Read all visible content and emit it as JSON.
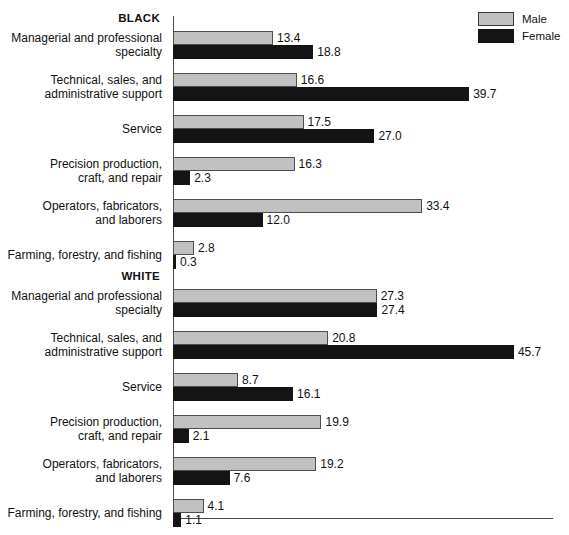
{
  "legend": {
    "position": "top-right",
    "items": [
      {
        "name": "Male",
        "swatch": "male-swatch",
        "color": "#c1c1c1"
      },
      {
        "name": "Female",
        "swatch": "female-swatch",
        "color": "#141414"
      }
    ]
  },
  "groups": [
    {
      "id": "black",
      "heading": "BLACK"
    },
    {
      "id": "white",
      "heading": "WHITE"
    }
  ],
  "chart_data": {
    "type": "bar",
    "orientation": "horizontal",
    "title": "",
    "subtitle": "",
    "xlabel": "",
    "ylabel": "",
    "xlim": [
      0,
      51
    ],
    "grid": false,
    "legend_position": "top-right",
    "value_format": "one-decimal",
    "categories": [
      "Managerial and professional specialty",
      "Technical, sales, and administrative support",
      "Service",
      "Precision production, craft, and repair",
      "Operators, fabricators, and laborers",
      "Farming, forestry, and fishing"
    ],
    "panels": [
      {
        "name": "BLACK",
        "series": [
          {
            "name": "Male",
            "values": [
              13.4,
              16.6,
              17.5,
              16.3,
              33.4,
              2.8
            ]
          },
          {
            "name": "Female",
            "values": [
              18.8,
              39.7,
              27.0,
              2.3,
              12.0,
              0.3
            ]
          }
        ]
      },
      {
        "name": "WHITE",
        "series": [
          {
            "name": "Male",
            "values": [
              27.3,
              20.8,
              8.7,
              19.9,
              19.2,
              4.1
            ]
          },
          {
            "name": "Female",
            "values": [
              27.4,
              45.7,
              16.1,
              2.1,
              7.6,
              1.1
            ]
          }
        ]
      }
    ]
  },
  "rows": {
    "black": [
      {
        "label_line1": "Managerial and professional",
        "label_line2": "specialty",
        "male": "13.4",
        "female": "18.8"
      },
      {
        "label_line1": "Technical, sales, and",
        "label_line2": "administrative support",
        "male": "16.6",
        "female": "39.7"
      },
      {
        "label_line1": "Service",
        "label_line2": "",
        "male": "17.5",
        "female": "27.0"
      },
      {
        "label_line1": "Precision production,",
        "label_line2": "craft, and repair",
        "male": "16.3",
        "female": "2.3"
      },
      {
        "label_line1": "Operators, fabricators,",
        "label_line2": "and laborers",
        "male": "33.4",
        "female": "12.0"
      },
      {
        "label_line1": "Farming, forestry, and fishing",
        "label_line2": "",
        "male": "2.8",
        "female": "0.3"
      }
    ],
    "white": [
      {
        "label_line1": "Managerial and professional",
        "label_line2": "specialty",
        "male": "27.3",
        "female": "27.4"
      },
      {
        "label_line1": "Technical, sales, and",
        "label_line2": "administrative support",
        "male": "20.8",
        "female": "45.7"
      },
      {
        "label_line1": "Service",
        "label_line2": "",
        "male": "8.7",
        "female": "16.1"
      },
      {
        "label_line1": "Precision production,",
        "label_line2": "craft, and repair",
        "male": "19.9",
        "female": "2.1"
      },
      {
        "label_line1": "Operators, fabricators,",
        "label_line2": "and laborers",
        "male": "19.2",
        "female": "7.6"
      },
      {
        "label_line1": "Farming, forestry, and fishing",
        "label_line2": "",
        "male": "4.1",
        "female": "1.1"
      }
    ]
  }
}
